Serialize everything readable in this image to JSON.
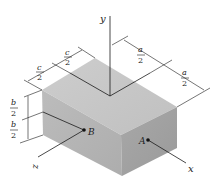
{
  "figure": {
    "type": "isometric rectangular block with coordinate axes",
    "axes": {
      "x": "x",
      "y": "y",
      "z": "z"
    },
    "points": [
      {
        "id": "A",
        "label": "A",
        "face": "front (x-face)"
      },
      {
        "id": "B",
        "label": "B",
        "face": "side (z-face)"
      }
    ],
    "dimensions": {
      "a_half_1": {
        "num": "a",
        "den": "2"
      },
      "a_half_2": {
        "num": "a",
        "den": "2"
      },
      "c_half_1": {
        "num": "c",
        "den": "2"
      },
      "c_half_2": {
        "num": "c",
        "den": "2"
      },
      "b_half_1": {
        "num": "b",
        "den": "2"
      },
      "b_half_2": {
        "num": "b",
        "den": "2"
      }
    },
    "colors": {
      "top_face": "#c8c8c8",
      "left_face": "#b4b4b4",
      "right_face": "#a2a2a2",
      "lines": "#1a1a1a"
    }
  }
}
